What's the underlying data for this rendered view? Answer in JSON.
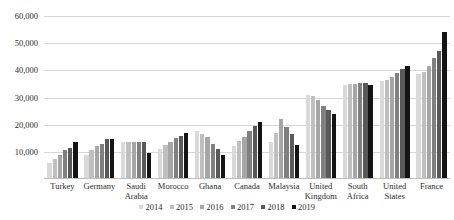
{
  "chart_data": {
    "type": "bar",
    "title": "",
    "xlabel": "",
    "ylabel": "",
    "ylim": [
      0,
      60000
    ],
    "grid": true,
    "legend_position": "bottom",
    "ytick_labels": [
      "60,000",
      "50,000",
      "40,000",
      "30,000",
      "20,000",
      "10,000"
    ],
    "ytick_values": [
      60000,
      50000,
      40000,
      30000,
      20000,
      10000
    ],
    "categories": [
      "Turkey",
      "Germany",
      "Saudi Arabia",
      "Morocco",
      "Ghana",
      "Canada",
      "Malaysia",
      "United Kingdom",
      "South Africa",
      "United States",
      "France"
    ],
    "series": [
      {
        "name": "2014",
        "color": "#d9d9d9",
        "values": [
          6000,
          9000,
          13500,
          11000,
          17500,
          12000,
          13500,
          31000,
          34500,
          36000,
          38500
        ]
      },
      {
        "name": "2015",
        "color": "#bfbfbf",
        "values": [
          7500,
          10500,
          13500,
          12500,
          16500,
          14000,
          17000,
          30500,
          35000,
          36500,
          39500
        ]
      },
      {
        "name": "2016",
        "color": "#a6a6a6",
        "values": [
          9000,
          12000,
          13500,
          13500,
          15500,
          15500,
          22000,
          29000,
          35000,
          37500,
          41500
        ]
      },
      {
        "name": "2017",
        "color": "#808080",
        "values": [
          10500,
          13000,
          13500,
          15000,
          13000,
          17500,
          19000,
          27000,
          35500,
          39000,
          44500
        ]
      },
      {
        "name": "2018",
        "color": "#595959",
        "values": [
          11500,
          14700,
          13500,
          16000,
          11000,
          19500,
          16500,
          25500,
          35500,
          40500,
          47000
        ]
      },
      {
        "name": "2019",
        "color": "#141414",
        "values": [
          13500,
          14700,
          9500,
          17000,
          9000,
          21000,
          12500,
          24000,
          34500,
          41500,
          54000
        ]
      }
    ]
  }
}
